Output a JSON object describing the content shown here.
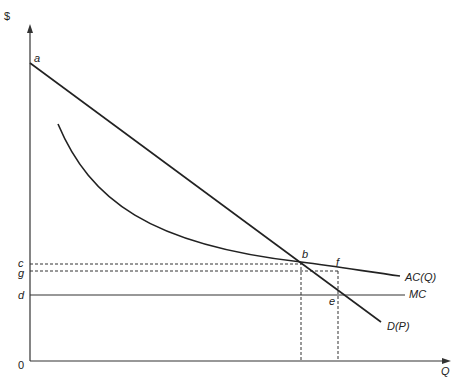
{
  "diagram": {
    "type": "economics-natural-monopoly",
    "axes": {
      "y_label": "$",
      "x_label": "Q",
      "origin_label": "0"
    },
    "curves": {
      "demand": "D(P)",
      "average_cost": "AC(Q)",
      "marginal_cost": "MC"
    },
    "points": {
      "a": "a",
      "b": "b",
      "c": "c",
      "d": "d",
      "e": "e",
      "f": "f",
      "g": "g"
    },
    "colors": {
      "line": "#222222",
      "background": "#ffffff"
    }
  }
}
